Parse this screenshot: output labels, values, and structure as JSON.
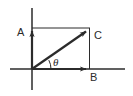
{
  "figure": {
    "background_color": "#ffffff",
    "line_color": "#2b2b2b",
    "width": 133,
    "height": 96
  },
  "axes": {
    "x_axis": {
      "name": "horizontal-axis",
      "x1": 10,
      "y1": 69,
      "x2": 125,
      "y2": 69
    },
    "y_axis": {
      "name": "vertical-axis",
      "x1": 32,
      "y1": 8,
      "x2": 32,
      "y2": 90
    },
    "origin": {
      "x": 32,
      "y": 69
    }
  },
  "vectors": [
    {
      "id": "A",
      "label": "A",
      "label_x": 17,
      "label_y": 36,
      "tip_x": 32,
      "tip_y": 28,
      "description": "vertical component vector pointing up"
    },
    {
      "id": "B",
      "label": "B",
      "label_x": 90,
      "label_y": 81,
      "tip_x": 89,
      "tip_y": 69,
      "description": "horizontal component vector pointing right"
    },
    {
      "id": "C",
      "label": "C",
      "label_x": 94,
      "label_y": 39,
      "tip_x": 90,
      "tip_y": 29,
      "description": "resultant diagonal vector"
    }
  ],
  "construction_lines": [
    {
      "name": "top-line",
      "x1": 32,
      "y1": 28,
      "x2": 90,
      "y2": 28
    },
    {
      "name": "right-line",
      "x1": 89.5,
      "y1": 28,
      "x2": 89.5,
      "y2": 69
    }
  ],
  "angle": {
    "label": "θ",
    "label_x": 53,
    "label_y": 66,
    "arc_radius": 19,
    "description": "angle theta between horizontal axis and resultant vector C"
  }
}
